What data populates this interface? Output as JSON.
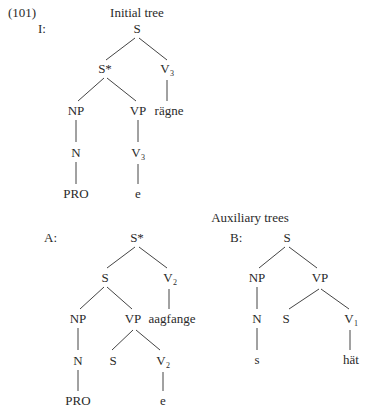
{
  "example_number": "(101)",
  "initial": {
    "heading": "Initial tree",
    "tag": "I:",
    "nodes": {
      "root": "S",
      "sstar": "S*",
      "v3_top": "V",
      "v3_top_sub": "3",
      "np": "NP",
      "vp": "VP",
      "ragne": "rägne",
      "n": "N",
      "v3_low": "V",
      "v3_low_sub": "3",
      "pro": "PRO",
      "e": "e"
    }
  },
  "auxiliary": {
    "heading": "Auxiliary trees",
    "a": {
      "tag": "A:",
      "nodes": {
        "root": "S*",
        "s": "S",
        "v2_top": "V",
        "v2_top_sub": "2",
        "np": "NP",
        "vp": "VP",
        "aagfange": "aagfange",
        "n": "N",
        "s_low": "S",
        "v2_low": "V",
        "v2_low_sub": "2",
        "pro": "PRO",
        "e": "e"
      }
    },
    "b": {
      "tag": "B:",
      "nodes": {
        "root": "S",
        "np": "NP",
        "vp": "VP",
        "n": "N",
        "s_low": "S",
        "v1": "V",
        "v1_sub": "1",
        "s": "s",
        "hat": "hät"
      }
    }
  }
}
